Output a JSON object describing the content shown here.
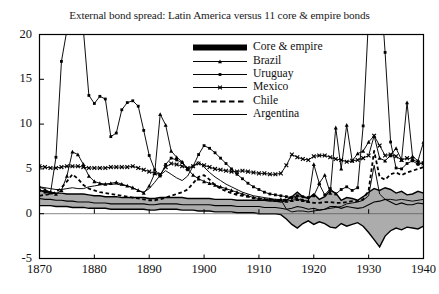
{
  "chart_data": {
    "type": "line",
    "title": "External bond spread: Latin America versus 11 core & empire bonds",
    "xlabel": "",
    "ylabel": "",
    "xlim": [
      1870,
      1940
    ],
    "ylim": [
      -5,
      20
    ],
    "grid": false,
    "legend_position": "top-center-inside",
    "xticks": [
      "1870",
      "1880",
      "1890",
      "1900",
      "1910",
      "1920",
      "1930",
      "1940"
    ],
    "yticks": [
      "20",
      "15",
      "10",
      "5",
      "0",
      "-5"
    ],
    "x": [
      1870,
      1871,
      1872,
      1873,
      1874,
      1875,
      1876,
      1877,
      1878,
      1879,
      1880,
      1881,
      1882,
      1883,
      1884,
      1885,
      1886,
      1887,
      1888,
      1889,
      1890,
      1891,
      1892,
      1893,
      1894,
      1895,
      1896,
      1897,
      1898,
      1899,
      1900,
      1901,
      1902,
      1903,
      1904,
      1905,
      1906,
      1907,
      1908,
      1909,
      1910,
      1911,
      1912,
      1913,
      1914,
      1915,
      1916,
      1917,
      1918,
      1919,
      1920,
      1921,
      1922,
      1923,
      1924,
      1925,
      1926,
      1927,
      1928,
      1929,
      1930,
      1931,
      1932,
      1933,
      1934,
      1935,
      1936,
      1937,
      1938,
      1939,
      1940
    ],
    "series": [
      {
        "name": "Core & empire",
        "style": "band",
        "description": "Shaded grey interquartile band with dark median line for 11 core & empire bonds",
        "upper": [
          2.6,
          2.5,
          2.4,
          2.3,
          2.3,
          2.2,
          2.2,
          2.2,
          2.2,
          2.1,
          2.0,
          2.0,
          1.9,
          1.9,
          1.9,
          1.8,
          1.8,
          1.8,
          1.8,
          1.8,
          1.7,
          1.7,
          1.8,
          1.8,
          1.8,
          1.8,
          1.8,
          1.7,
          1.7,
          1.7,
          1.7,
          1.7,
          1.6,
          1.6,
          1.6,
          1.6,
          1.5,
          1.5,
          1.5,
          1.5,
          1.5,
          1.5,
          1.4,
          1.4,
          1.3,
          1.5,
          1.9,
          2.4,
          1.9,
          1.7,
          2.2,
          1.6,
          1.9,
          2.6,
          2.3,
          1.5,
          1.8,
          1.7,
          1.5,
          1.9,
          2.4,
          2.8,
          2.6,
          2.9,
          2.7,
          2.3,
          2.5,
          2.1,
          2.2,
          2.5,
          2.3
        ],
        "median": [
          1.7,
          1.6,
          1.6,
          1.5,
          1.5,
          1.4,
          1.4,
          1.3,
          1.3,
          1.3,
          1.2,
          1.2,
          1.2,
          1.1,
          1.1,
          1.1,
          1.1,
          1.1,
          1.1,
          1.1,
          1.0,
          1.0,
          1.1,
          1.1,
          1.1,
          1.1,
          1.0,
          1.0,
          1.0,
          1.0,
          1.0,
          1.0,
          0.9,
          0.9,
          0.9,
          0.9,
          0.8,
          0.8,
          0.8,
          0.8,
          0.8,
          0.7,
          0.7,
          0.7,
          0.6,
          0.5,
          0.6,
          0.8,
          0.7,
          0.5,
          0.6,
          0.4,
          0.5,
          0.8,
          0.8,
          0.6,
          0.8,
          0.7,
          0.6,
          0.7,
          1.0,
          1.3,
          1.4,
          1.6,
          1.3,
          1.0,
          1.2,
          1.0,
          1.0,
          1.2,
          1.1
        ],
        "lower": [
          0.9,
          0.9,
          0.9,
          0.8,
          0.8,
          0.8,
          0.7,
          0.7,
          0.7,
          0.6,
          0.6,
          0.6,
          0.6,
          0.5,
          0.5,
          0.5,
          0.5,
          0.5,
          0.5,
          0.5,
          0.4,
          0.4,
          0.5,
          0.5,
          0.5,
          0.5,
          0.4,
          0.4,
          0.4,
          0.3,
          0.3,
          0.3,
          0.2,
          0.2,
          0.2,
          0.2,
          0.1,
          0.1,
          0.1,
          0.1,
          0.0,
          0.0,
          0.0,
          0.0,
          -0.1,
          -0.6,
          -1.2,
          -1.6,
          -1.1,
          -0.8,
          -1.2,
          -0.9,
          -1.1,
          -1.5,
          -1.6,
          -1.1,
          -1.4,
          -1.2,
          -1.0,
          -1.4,
          -2.1,
          -2.9,
          -3.7,
          -2.5,
          -1.9,
          -1.6,
          -1.8,
          -1.5,
          -1.6,
          -1.7,
          -1.4
        ]
      },
      {
        "name": "Brazil",
        "style": "line-marker-triangle",
        "values": [
          3.0,
          2.7,
          2.4,
          2.2,
          2.6,
          4.2,
          6.9,
          6.6,
          5.5,
          4.2,
          3.6,
          3.4,
          3.3,
          3.4,
          3.5,
          3.3,
          3.1,
          2.9,
          2.6,
          2.3,
          3.1,
          4.5,
          11.1,
          9.9,
          7.0,
          6.3,
          5.8,
          5.0,
          4.3,
          3.9,
          3.6,
          3.4,
          3.2,
          3.0,
          2.8,
          2.6,
          2.4,
          2.2,
          2.0,
          1.8,
          1.7,
          1.6,
          1.6,
          1.5,
          1.6,
          1.4,
          1.5,
          1.6,
          1.5,
          1.4,
          5.5,
          3.4,
          4.3,
          2.3,
          9.6,
          5.0,
          9.9,
          5.9,
          6.7,
          7.0,
          8.0,
          8.7,
          6.2,
          5.9,
          6.5,
          7.3,
          6.0,
          12.4,
          6.4,
          5.9,
          8.0
        ]
      },
      {
        "name": "Uruguay",
        "style": "line-marker-dot",
        "values": [
          2.6,
          2.4,
          2.3,
          6.3,
          17.0,
          20.5,
          21.0,
          20.8,
          20.5,
          13.2,
          12.3,
          13.1,
          12.8,
          8.6,
          9.0,
          11.6,
          12.4,
          12.6,
          12.0,
          9.3,
          6.5,
          4.9,
          4.2,
          5.5,
          6.2,
          6.0,
          5.7,
          4.9,
          5.3,
          6.6,
          7.6,
          7.3,
          6.8,
          6.2,
          5.6,
          5.0,
          4.4,
          3.9,
          3.4,
          3.0,
          2.7,
          2.4,
          2.2,
          2.1,
          2.0,
          1.9,
          1.8,
          2.0,
          1.9,
          1.8,
          2.0,
          3.3,
          2.1,
          2.8,
          2.2,
          2.7,
          3.0,
          2.6,
          2.9,
          9.8,
          22.0,
          30.0,
          27.0,
          18.0,
          8.0,
          5.1,
          5.0,
          5.6,
          5.9,
          5.5,
          5.7
        ]
      },
      {
        "name": "Mexico",
        "style": "line-marker-x",
        "values": [
          5.3,
          5.2,
          5.1,
          5.1,
          5.2,
          5.3,
          5.3,
          5.3,
          5.2,
          5.1,
          5.1,
          5.1,
          5.1,
          5.2,
          5.2,
          5.2,
          5.2,
          5.3,
          5.1,
          4.9,
          4.7,
          4.5,
          4.4,
          5.2,
          5.6,
          5.5,
          5.3,
          5.1,
          5.3,
          5.6,
          5.4,
          5.2,
          5.0,
          4.9,
          4.8,
          4.7,
          4.7,
          4.8,
          4.7,
          4.6,
          4.5,
          4.5,
          4.4,
          4.4,
          4.5,
          5.4,
          6.6,
          6.3,
          6.1,
          6.0,
          6.4,
          6.5,
          6.5,
          6.3,
          6.1,
          6.0,
          5.8,
          5.9,
          6.0,
          6.2,
          6.5,
          8.7,
          7.6,
          6.5,
          6.6,
          6.4,
          6.0,
          6.2,
          6.1,
          5.7,
          5.6
        ]
      },
      {
        "name": "Chile",
        "style": "dashed",
        "values": [
          2.0,
          2.1,
          2.2,
          2.4,
          2.9,
          3.6,
          4.4,
          3.9,
          3.2,
          2.8,
          2.6,
          2.4,
          2.3,
          2.2,
          2.1,
          2.0,
          1.9,
          1.8,
          1.7,
          1.6,
          1.5,
          1.5,
          1.6,
          1.8,
          2.0,
          2.2,
          2.4,
          2.7,
          3.4,
          4.1,
          4.3,
          3.8,
          3.2,
          2.8,
          2.5,
          2.3,
          2.1,
          2.0,
          1.9,
          1.8,
          1.7,
          1.6,
          1.6,
          1.5,
          1.5,
          1.6,
          1.9,
          1.7,
          1.5,
          1.3,
          1.2,
          1.2,
          1.3,
          1.3,
          1.2,
          1.2,
          1.3,
          1.4,
          1.4,
          1.6,
          2.6,
          7.0,
          4.1,
          3.8,
          4.4,
          4.6,
          4.3,
          4.6,
          4.8,
          5.0,
          5.2
        ]
      },
      {
        "name": "Argentina",
        "style": "plain",
        "values": [
          3.0,
          2.9,
          2.8,
          2.7,
          2.7,
          2.8,
          2.9,
          2.8,
          2.8,
          3.0,
          3.1,
          3.2,
          3.3,
          3.3,
          3.3,
          3.2,
          3.1,
          2.9,
          2.6,
          2.4,
          2.8,
          3.5,
          4.3,
          4.8,
          4.4,
          4.0,
          3.7,
          4.2,
          5.3,
          5.8,
          5.2,
          4.6,
          4.1,
          3.7,
          3.3,
          3.0,
          2.7,
          2.4,
          2.2,
          2.0,
          1.9,
          1.8,
          1.7,
          1.6,
          1.6,
          0.5,
          0.2,
          0.3,
          0.3,
          0.2,
          0.3,
          0.4,
          0.5,
          0.6,
          0.7,
          0.8,
          1.1,
          1.2,
          1.3,
          1.5,
          2.0,
          5.4,
          2.2,
          1.6,
          1.6,
          1.5,
          1.6,
          1.5,
          1.4,
          1.5,
          1.6
        ]
      }
    ]
  },
  "axes": {
    "yticks": [
      {
        "label": "20",
        "value": 20
      },
      {
        "label": "15",
        "value": 15
      },
      {
        "label": "10",
        "value": 10
      },
      {
        "label": "5",
        "value": 5
      },
      {
        "label": "0",
        "value": 0
      },
      {
        "label": "-5",
        "value": -5
      }
    ],
    "xticks": [
      {
        "label": "1870",
        "value": 1870
      },
      {
        "label": "1880",
        "value": 1880
      },
      {
        "label": "1890",
        "value": 1890
      },
      {
        "label": "1900",
        "value": 1900
      },
      {
        "label": "1910",
        "value": 1910
      },
      {
        "label": "1920",
        "value": 1920
      },
      {
        "label": "1930",
        "value": 1930
      },
      {
        "label": "1940",
        "value": 1940
      }
    ]
  },
  "legend": {
    "items": [
      {
        "label": "Core & empire",
        "style": "thick-black-bar",
        "color": "#000000"
      },
      {
        "label": "Brazil",
        "style": "line-marker-triangle",
        "color": "#000000"
      },
      {
        "label": "Uruguay",
        "style": "line-marker-dot",
        "color": "#000000"
      },
      {
        "label": "Mexico",
        "style": "line-marker-x",
        "color": "#000000"
      },
      {
        "label": "Chile",
        "style": "dashed",
        "color": "#000000"
      },
      {
        "label": "Argentina",
        "style": "plain",
        "color": "#000000"
      }
    ]
  },
  "colors": {
    "band_fill": "#a8a8a8",
    "line": "#000000",
    "frame": "#000000",
    "background": "#ffffff"
  }
}
